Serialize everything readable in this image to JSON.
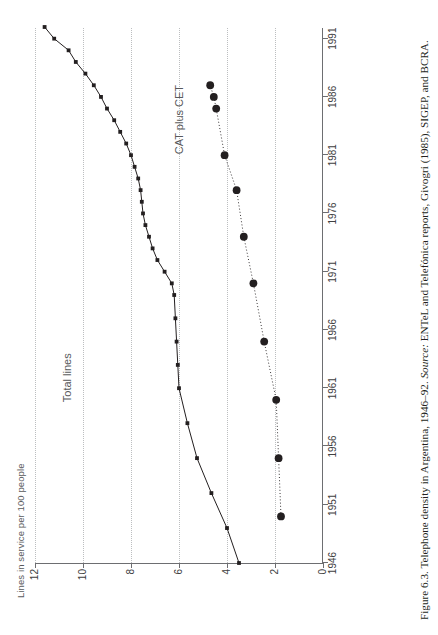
{
  "figure": {
    "caption_prefix": "Figure 6.3. Telephone density in Argentina, 1946–92. ",
    "caption_source_lead": "Source:",
    "caption_source_body": " ENTeL and Telefónica reports, Givogri (1985), SIGEP, and BCRA."
  },
  "chart_data": {
    "type": "line",
    "title": "",
    "subtitle": "",
    "xlabel": "",
    "ylabel": "Lines in service per 100 people",
    "xlim": [
      1946,
      1992
    ],
    "ylim": [
      0,
      12
    ],
    "grid": true,
    "grid_axis": "y",
    "legend_position": "inline-annotation",
    "xticks": [
      1946,
      1951,
      1956,
      1961,
      1966,
      1971,
      1976,
      1981,
      1986,
      1991
    ],
    "xtick_labels": [
      "1946",
      "1951",
      "1956",
      "1961",
      "1966",
      "1971",
      "1976",
      "1981",
      "1986",
      "1991"
    ],
    "yticks": [
      0,
      2,
      4,
      6,
      8,
      10,
      12
    ],
    "ytick_labels": [
      "0",
      "2",
      "4",
      "6",
      "8",
      "10",
      "12"
    ],
    "colors": {
      "total_lines": "#231f20",
      "cat_plus_cet": "#231f20",
      "axis": "#6d6e71",
      "grid": "#bcbec0",
      "label_text": "#58595b"
    },
    "series": [
      {
        "name": "Total lines",
        "marker": "square",
        "linestyle": "solid",
        "annotation": "Total lines",
        "x": [
          1946,
          1949,
          1952,
          1955,
          1958,
          1961,
          1963,
          1965,
          1967,
          1969,
          1970,
          1971,
          1972,
          1973,
          1974,
          1975,
          1976,
          1977,
          1978,
          1979,
          1980,
          1981,
          1982,
          1983,
          1984,
          1985,
          1986,
          1987,
          1988,
          1989,
          1990,
          1991,
          1992
        ],
        "values": [
          3.5,
          4.0,
          4.65,
          5.25,
          5.65,
          6.0,
          6.05,
          6.1,
          6.15,
          6.2,
          6.3,
          6.6,
          6.9,
          7.1,
          7.25,
          7.4,
          7.5,
          7.55,
          7.6,
          7.7,
          7.85,
          8.0,
          8.2,
          8.45,
          8.7,
          9.0,
          9.25,
          9.55,
          9.9,
          10.3,
          10.6,
          11.2,
          11.6
        ]
      },
      {
        "name": "CAT plus CET",
        "marker": "circle",
        "linestyle": "dotted",
        "annotation": "CAT plus CET",
        "x": [
          1950,
          1955,
          1960,
          1965,
          1970,
          1974,
          1978,
          1981,
          1985,
          1986,
          1987
        ],
        "values": [
          1.75,
          1.85,
          1.95,
          2.45,
          2.9,
          3.3,
          3.6,
          4.1,
          4.45,
          4.55,
          4.7
        ]
      }
    ]
  }
}
